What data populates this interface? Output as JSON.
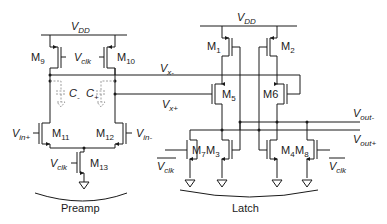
{
  "diagram": {
    "type": "circuit-schematic",
    "sections": {
      "preamp": {
        "label": "Preamp"
      },
      "latch": {
        "label": "Latch"
      }
    },
    "supply": {
      "preamp_vdd": {
        "v": "V",
        "sub": "DD"
      },
      "latch_vdd": {
        "v": "V",
        "sub": "DD"
      }
    },
    "transistors": {
      "m9": {
        "m": "M",
        "sub": "9"
      },
      "m10": {
        "m": "M",
        "sub": "10"
      },
      "m11": {
        "m": "M",
        "sub": "11"
      },
      "m12": {
        "m": "M",
        "sub": "12"
      },
      "m13": {
        "m": "M",
        "sub": "13"
      },
      "m1": {
        "m": "M",
        "sub": "1"
      },
      "m2": {
        "m": "M",
        "sub": "2"
      },
      "m3": {
        "m": "M",
        "sub": "3"
      },
      "m4": {
        "m": "M",
        "sub": "4"
      },
      "m5": {
        "m": "M",
        "sub": "5"
      },
      "m6": {
        "label": "M6"
      },
      "m7": {
        "m": "M",
        "sub": "7"
      },
      "m8": {
        "m": "M",
        "sub": "8"
      }
    },
    "capacitors": {
      "c_minus": {
        "c": "C",
        "sub": "-"
      },
      "c_plus": {
        "c": "C",
        "sub": "+"
      }
    },
    "signals": {
      "vclk_top": {
        "v": "V",
        "sub": "clk"
      },
      "vclk_m13": {
        "v": "V",
        "sub": "clk"
      },
      "vclk_bar_left": {
        "v": "V",
        "sub": "clk"
      },
      "vclk_bar_right": {
        "v": "V",
        "sub": "clk"
      },
      "vin_plus": {
        "v": "V",
        "sub": "in+"
      },
      "vin_minus": {
        "v": "V",
        "sub": "in-"
      },
      "vx_minus": {
        "v": "V",
        "sub": "x-"
      },
      "vx_plus": {
        "v": "V",
        "sub": "x+"
      },
      "vout_minus": {
        "v": "V",
        "sub": "out-"
      },
      "vout_plus": {
        "v": "V",
        "sub": "out+"
      }
    }
  }
}
